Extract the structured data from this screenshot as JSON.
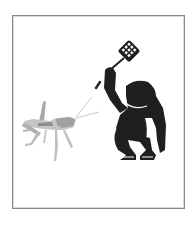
{
  "illustration": {
    "subject": "figure swatting a grasshopper with a flyswatter",
    "elements": [
      {
        "name": "grasshopper",
        "icon": "grasshopper-icon"
      },
      {
        "name": "crouching-figure",
        "icon": "person-silhouette-icon"
      },
      {
        "name": "flyswatter",
        "icon": "flyswatter-icon"
      }
    ]
  },
  "colors": {
    "frame_border": "#8a8a8a",
    "figure": "#1f1f1f",
    "figure_outline": "#ffffff",
    "grasshopper_light": "#c4c4c4",
    "grasshopper_dark": "#8e8e8e",
    "background": "#ffffff"
  }
}
